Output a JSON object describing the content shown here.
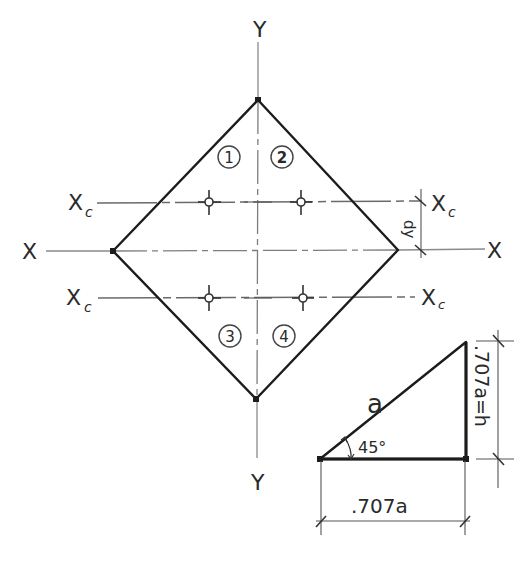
{
  "diagram": {
    "type": "hand-drawn section diagram",
    "colors": {
      "outline": "#1c1c1c",
      "axis": "#8a8a8a",
      "text": "#2a2a2a"
    },
    "axes": {
      "y_top_label": "Y",
      "y_bottom_label": "Y",
      "x_left_label": "X",
      "x_right_label": "X"
    },
    "centroid_axes": {
      "upper_left_label": "Xc",
      "upper_right_label": "Xc",
      "lower_left_label": "Xc",
      "lower_right_label": "Xc",
      "subscript": "c",
      "main": "X"
    },
    "regions": [
      {
        "id": "region-1",
        "label": "1"
      },
      {
        "id": "region-2",
        "label": "2"
      },
      {
        "id": "region-3",
        "label": "3"
      },
      {
        "id": "region-4",
        "label": "4"
      }
    ],
    "dimension": {
      "offset_label": "dy"
    },
    "triangle": {
      "hypotenuse_label": "a",
      "angle_label": "45°",
      "base_label": ".707a",
      "height_label": ".707a=h"
    }
  }
}
